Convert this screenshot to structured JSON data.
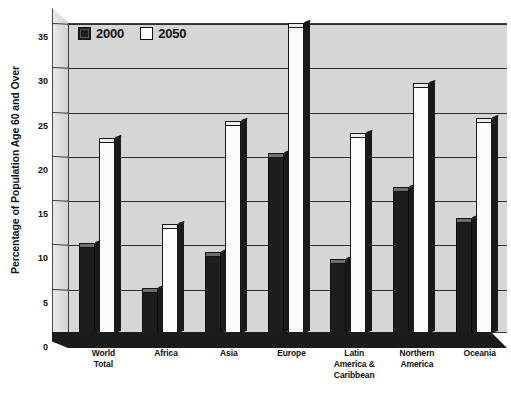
{
  "chart_data": {
    "type": "bar",
    "title": "",
    "xlabel": "",
    "ylabel": "Percentage of Population Age 60 and Over",
    "ylim": [
      0,
      35
    ],
    "yticks": [
      0,
      5,
      10,
      15,
      20,
      25,
      30,
      35
    ],
    "ytick_labels": [
      "0",
      "5",
      "10",
      "15",
      "20",
      "25",
      "30",
      "35"
    ],
    "grid": true,
    "legend_position": "top-left-inside",
    "categories": [
      "World Total",
      "Africa",
      "Asia",
      "Europe",
      "Latin America & Caribbean",
      "Northern America",
      "Oceania"
    ],
    "category_lines": [
      [
        "World",
        "Total"
      ],
      [
        "Africa"
      ],
      [
        "Asia"
      ],
      [
        "Europe"
      ],
      [
        "Latin",
        "America &",
        "Caribbean"
      ],
      [
        "Northern",
        "America"
      ],
      [
        "Oceania"
      ]
    ],
    "series": [
      {
        "name": "2000",
        "color": "#1d1d1d",
        "values": [
          9.8,
          4.8,
          8.8,
          20.0,
          8.0,
          16.2,
          12.6
        ]
      },
      {
        "name": "2050",
        "color": "#fbfbfb",
        "values": [
          21.7,
          12.0,
          23.6,
          34.7,
          22.2,
          27.9,
          23.9
        ]
      }
    ]
  },
  "legend": {
    "items": [
      {
        "label": "2000",
        "swatch": "dark-swatch-icon"
      },
      {
        "label": "2050",
        "swatch": "light-swatch-icon"
      }
    ]
  },
  "style": {
    "plot_background": "#d6d6d6",
    "gridline_color": "#2f2f2f",
    "axis_color": "#3c3c3c",
    "floor_color": "#1b1b1b",
    "page_background": "#ffffff"
  }
}
